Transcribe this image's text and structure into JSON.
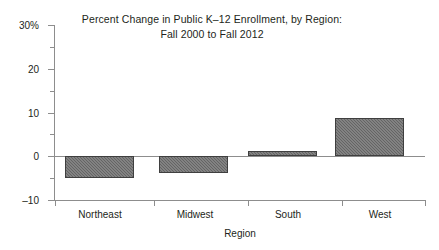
{
  "chart_data": {
    "type": "bar",
    "title": "Percent Change in Public K–12 Enrollment, by Region:",
    "subtitle": "Fall 2000 to Fall 2012",
    "title_lines": [
      "Percent Change in Public K–12 Enrollment, by Region:",
      "Fall 2000 to Fall 2012"
    ],
    "xlabel": "Region",
    "ylabel": "",
    "categories": [
      "Northeast",
      "Midwest",
      "South",
      "West"
    ],
    "values": [
      -5,
      -3.8,
      1.3,
      8.8
    ],
    "ylim": [
      -10,
      30
    ],
    "y_major_ticks": [
      -10,
      0,
      10,
      20,
      30
    ],
    "y_minor_ticks": [
      -5,
      5,
      15,
      25
    ],
    "y_tick_labels": [
      "–10",
      "0",
      "10",
      "20",
      "30%"
    ],
    "grid": false,
    "legend": false,
    "zero_line": true,
    "bar_color": "#6e6e6e",
    "bar_border_color": "#3f3f3f",
    "axis_color": "#8d8d8d",
    "text_color": "#231f20",
    "background": "#ffffff",
    "bars": [
      {
        "category": "Northeast",
        "value": -5,
        "label": "Northeast"
      },
      {
        "category": "Midwest",
        "value": -3.8,
        "label": "Midwest"
      },
      {
        "category": "South",
        "value": 1.3,
        "label": "South"
      },
      {
        "category": "West",
        "value": 8.8,
        "label": "West"
      }
    ]
  }
}
